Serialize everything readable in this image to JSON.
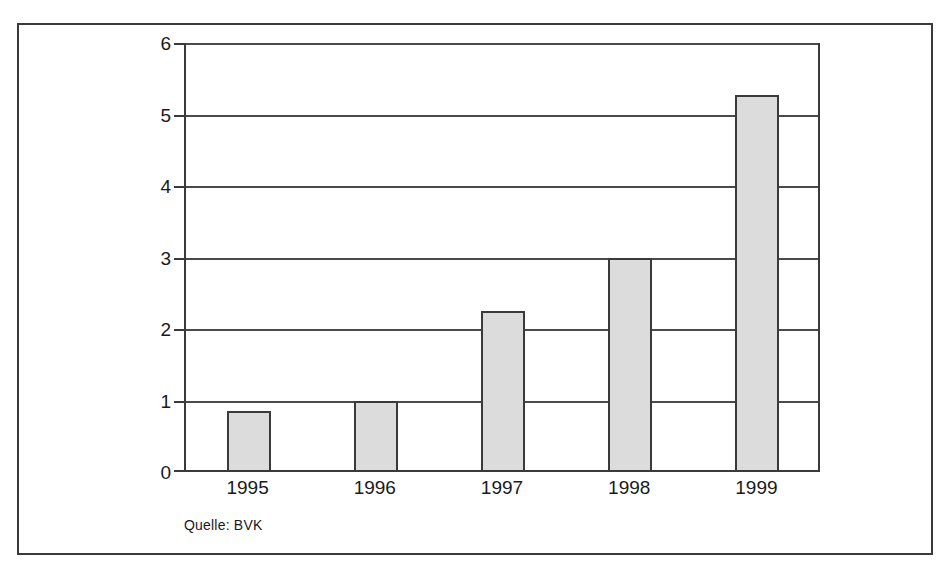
{
  "chart_data": {
    "type": "bar",
    "title": "",
    "subtitle": "",
    "xlabel": "",
    "ylabel": "",
    "categories": [
      "1995",
      "1996",
      "1997",
      "1998",
      "1999"
    ],
    "values": [
      0.85,
      1.0,
      2.25,
      3.0,
      5.27
    ],
    "series": [
      {
        "name": "",
        "values": [
          0.85,
          1.0,
          2.25,
          3.0,
          5.27
        ]
      }
    ],
    "ylim": [
      0,
      6
    ],
    "ytick_labels": [
      "6",
      "5",
      "4",
      "3",
      "2",
      "1",
      "0"
    ],
    "ytick_values": [
      6,
      5,
      4,
      3,
      2,
      1,
      0
    ],
    "grid": true,
    "legend": false,
    "legend_position": "none",
    "annotations": [
      "Quelle: BVK"
    ],
    "source_note": "Quelle: BVK",
    "colors": {
      "bar_fill": "#dcdcdc",
      "bar_stroke": "#3a3a3a",
      "axis": "#3a3a3a",
      "grid": "#4a4a4a",
      "frame": "#3a3a3a",
      "text": "#1a1a1a",
      "background": "#ffffff"
    }
  }
}
